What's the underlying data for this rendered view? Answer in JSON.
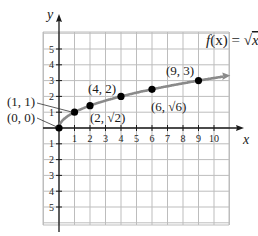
{
  "chart_data": {
    "type": "line",
    "title": "f(x) = √x",
    "function_label": {
      "f": "f",
      "x_arg": "(x)",
      "eq": " = ",
      "rad": "√",
      "rad_arg": "x"
    },
    "xlabel": "x",
    "ylabel": "y",
    "xlim": [
      -1,
      10
    ],
    "ylim": [
      -5,
      5
    ],
    "grid": true,
    "x_ticks": [
      "1",
      "2",
      "3",
      "4",
      "5",
      "6",
      "7",
      "8",
      "9",
      "10"
    ],
    "y_ticks_pos": [
      "1",
      "2",
      "3",
      "4",
      "5"
    ],
    "y_ticks_neg": [
      "1",
      "2",
      "3",
      "4",
      "5"
    ],
    "series": [
      {
        "name": "f(x) = √x",
        "color": "#8a8a8a",
        "x": [
          0,
          1,
          2,
          4,
          6,
          9
        ],
        "y": [
          0,
          1,
          1.414,
          2,
          2.449,
          3
        ]
      }
    ],
    "points": [
      {
        "label": "(0, 0)",
        "x": 0,
        "y": 0
      },
      {
        "label": "(1, 1)",
        "x": 1,
        "y": 1
      },
      {
        "label": "(2, √2)",
        "x": 2,
        "y": 1.414
      },
      {
        "label": "(4, 2)",
        "x": 4,
        "y": 2
      },
      {
        "label": "(6, √6)",
        "x": 6,
        "y": 2.449
      },
      {
        "label": "(9, 3)",
        "x": 9,
        "y": 3
      }
    ]
  },
  "colors": {
    "grid": "#bdbdbd",
    "axis": "#1a1a1a",
    "curve": "#8a8a8a",
    "point": "#000000"
  }
}
